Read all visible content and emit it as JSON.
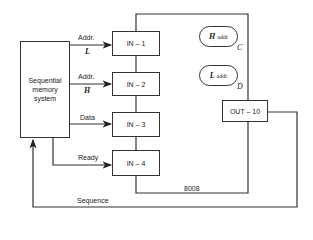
{
  "diagram": {
    "memory": {
      "line1": "Sequential",
      "line2": "memory",
      "line3": "system"
    },
    "signals": [
      {
        "label": "Addr.",
        "sub": "L"
      },
      {
        "label": "Addr.",
        "sub": "H"
      },
      {
        "label": "Data"
      },
      {
        "label": "Ready"
      }
    ],
    "inputs": [
      "IN – 1",
      "IN – 2",
      "IN – 3",
      "IN – 4"
    ],
    "registers": [
      {
        "name": "H",
        "suffix": "addr",
        "reg": "C"
      },
      {
        "name": "L",
        "suffix": "addr",
        "reg": "D"
      }
    ],
    "output": "OUT – 10",
    "chip": "8008",
    "feedback": "Sequence"
  }
}
